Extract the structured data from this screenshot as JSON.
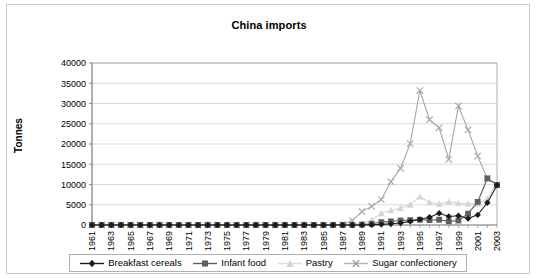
{
  "chart_data": {
    "type": "line",
    "title": "China imports",
    "xlabel": "",
    "ylabel": "Tonnes",
    "ylim": [
      0,
      40000
    ],
    "ytick_step": 5000,
    "yticks": [
      "0",
      "5000",
      "10000",
      "15000",
      "20000",
      "25000",
      "30000",
      "35000",
      "40000"
    ],
    "grid": "horizontal",
    "legend_position": "bottom",
    "x_tick_labels": [
      "1961",
      "1963",
      "1965",
      "1967",
      "1969",
      "1971",
      "1973",
      "1975",
      "1977",
      "1979",
      "1981",
      "1983",
      "1985",
      "1987",
      "1989",
      "1991",
      "1993",
      "1995",
      "1997",
      "1999",
      "2001",
      "2003"
    ],
    "x": [
      1961,
      1962,
      1963,
      1964,
      1965,
      1966,
      1967,
      1968,
      1969,
      1970,
      1971,
      1972,
      1973,
      1974,
      1975,
      1976,
      1977,
      1978,
      1979,
      1980,
      1981,
      1982,
      1983,
      1984,
      1985,
      1986,
      1987,
      1988,
      1989,
      1990,
      1991,
      1992,
      1993,
      1994,
      1995,
      1996,
      1997,
      1998,
      1999,
      2000,
      2001,
      2002,
      2003
    ],
    "series": [
      {
        "name": "Breakfast cereals",
        "marker": "diamond",
        "color": "#1a1a1a",
        "values": [
          0,
          0,
          0,
          0,
          0,
          0,
          0,
          0,
          0,
          0,
          0,
          0,
          0,
          0,
          0,
          0,
          0,
          0,
          0,
          0,
          0,
          0,
          0,
          0,
          0,
          0,
          0,
          0,
          0,
          60,
          150,
          300,
          500,
          900,
          1400,
          1900,
          2900,
          2100,
          2300,
          1600,
          2500,
          5500,
          9800
        ]
      },
      {
        "name": "Infant food",
        "marker": "square",
        "color": "#5e5e5e",
        "values": [
          0,
          0,
          0,
          0,
          0,
          0,
          0,
          0,
          0,
          0,
          0,
          0,
          0,
          0,
          0,
          0,
          0,
          0,
          0,
          0,
          0,
          0,
          0,
          0,
          0,
          0,
          0,
          0,
          100,
          300,
          700,
          900,
          1100,
          1200,
          1300,
          1200,
          1300,
          900,
          1100,
          2800,
          5700,
          11500,
          9900
        ]
      },
      {
        "name": "Pastry",
        "marker": "triangle",
        "color": "#d4d4d4",
        "values": [
          0,
          0,
          0,
          0,
          0,
          0,
          0,
          0,
          0,
          0,
          0,
          0,
          0,
          0,
          0,
          0,
          0,
          0,
          0,
          0,
          0,
          0,
          0,
          0,
          0,
          0,
          0,
          100,
          400,
          1200,
          2900,
          3600,
          4200,
          5000,
          7000,
          5600,
          5200,
          5700,
          5400,
          5300,
          5200,
          6500,
          10200
        ]
      },
      {
        "name": "Sugar confectionery",
        "marker": "x",
        "color": "#a6a6a6",
        "values": [
          0,
          0,
          0,
          0,
          0,
          0,
          0,
          0,
          0,
          0,
          0,
          0,
          0,
          0,
          0,
          0,
          0,
          0,
          0,
          0,
          0,
          0,
          0,
          0,
          0,
          0,
          100,
          1100,
          3300,
          4600,
          6300,
          10700,
          14000,
          20100,
          33200,
          26000,
          24000,
          16200,
          29400,
          23500,
          17000,
          11500,
          9900
        ]
      }
    ]
  },
  "legend": {
    "items": [
      {
        "label": "Breakfast cereals"
      },
      {
        "label": "Infant food"
      },
      {
        "label": "Pastry"
      },
      {
        "label": "Sugar confectionery"
      }
    ]
  }
}
